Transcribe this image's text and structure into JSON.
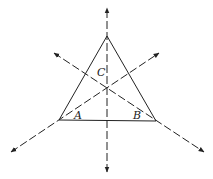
{
  "diagram": {
    "type": "triangle with angle bisectors / medians meeting at a point",
    "vertices": {
      "top": {
        "label": "C",
        "x": 107,
        "y": 36
      },
      "left": {
        "label": "A",
        "x": 59,
        "y": 120
      },
      "right": {
        "label": "B",
        "x": 156,
        "y": 121
      }
    },
    "center": {
      "x": 107,
      "y": 88
    },
    "labels": {
      "a": "A",
      "b": "B",
      "c": "C"
    },
    "colors": {
      "line": "#222222",
      "background": "#ffffff"
    }
  }
}
